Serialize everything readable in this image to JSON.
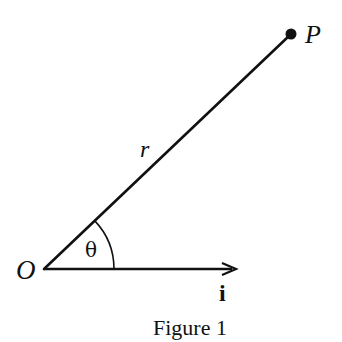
{
  "figure": {
    "caption": "Figure 1",
    "labels": {
      "origin": "O",
      "point": "P",
      "radius": "r",
      "angle": "θ",
      "unit_vector": "i"
    },
    "colors": {
      "ink": "#111111",
      "background": "#ffffff"
    },
    "geometry": {
      "origin_xy": [
        44,
        269
      ],
      "point_xy": [
        291,
        34
      ],
      "unit_vector_tip_xy": [
        236,
        269
      ],
      "angle_arc_radius": 70
    }
  }
}
